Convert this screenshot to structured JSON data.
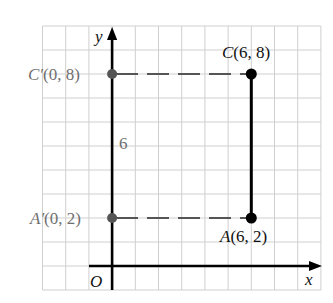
{
  "diagram": {
    "type": "coordinate-plane",
    "grid": {
      "x_min": -3,
      "x_max": 9,
      "y_min": -1,
      "y_max": 10,
      "grid_color": "#c8c8c8"
    },
    "axes": {
      "x_label": "x",
      "y_label": "y",
      "origin_label": "O"
    },
    "points": [
      {
        "id": "C",
        "label": "C(6, 8)",
        "x": 6,
        "y": 8,
        "color": "#000000"
      },
      {
        "id": "A",
        "label": "A(6, 2)",
        "x": 6,
        "y": 2,
        "color": "#000000"
      },
      {
        "id": "C_prime",
        "label": "C′(0, 8)",
        "x": 0,
        "y": 8,
        "color": "#555555"
      },
      {
        "id": "A_prime",
        "label": "A′(0, 2)",
        "x": 0,
        "y": 2,
        "color": "#555555"
      }
    ],
    "segments": [
      {
        "from": "A",
        "to": "C",
        "style": "solid",
        "color": "#000000"
      },
      {
        "from": "C_prime",
        "to": "C",
        "style": "dashed",
        "color": "#555555"
      },
      {
        "from": "A_prime",
        "to": "A",
        "style": "dashed",
        "color": "#555555"
      }
    ],
    "annotations": [
      {
        "text": "6",
        "x": 0.5,
        "y": 5,
        "meaning": "length of segment A'C'"
      }
    ]
  },
  "labels": {
    "y_axis": "y",
    "x_axis": "x",
    "origin": "O",
    "c_prime": "C′(0, 8)",
    "a_prime": "A′(0, 2)",
    "c": "C(6, 8)",
    "a": "A(6, 2)",
    "length": "6"
  }
}
